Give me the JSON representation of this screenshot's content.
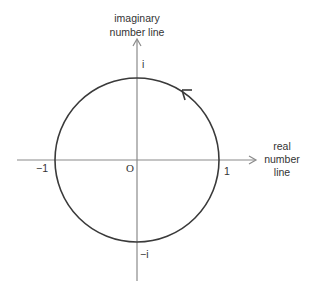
{
  "diagram": {
    "colors": {
      "axis": "#8a8a8a",
      "circle": "#3a3a3a",
      "text": "#333333",
      "background": "#ffffff"
    },
    "vertical_axis": {
      "label_line1": "imaginary",
      "label_line2": "number line"
    },
    "horizontal_axis": {
      "label_line1": "real",
      "label_line2": "number",
      "label_line3": "line"
    },
    "points": {
      "origin": "O",
      "plus_one": "1",
      "minus_one": "−1",
      "plus_i": "i",
      "minus_i": "−i"
    },
    "circle": {
      "center": [
        137,
        160
      ],
      "radius": 82,
      "direction": "counterclockwise"
    }
  }
}
